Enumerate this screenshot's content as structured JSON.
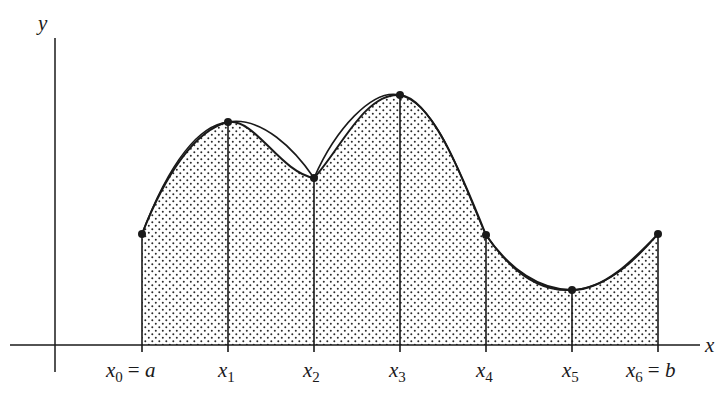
{
  "diagram": {
    "axes": {
      "x_label": "x",
      "y_label": "y"
    },
    "colors": {
      "ink": "#1a1a1a",
      "background": "#ffffff",
      "dot_fill": "#2a2a2a"
    },
    "partition_labels": [
      {
        "var": "x",
        "sub": "0",
        "suffix": "= a"
      },
      {
        "var": "x",
        "sub": "1",
        "suffix": ""
      },
      {
        "var": "x",
        "sub": "2",
        "suffix": ""
      },
      {
        "var": "x",
        "sub": "3",
        "suffix": ""
      },
      {
        "var": "x",
        "sub": "4",
        "suffix": ""
      },
      {
        "var": "x",
        "sub": "5",
        "suffix": ""
      },
      {
        "var": "x",
        "sub": "6",
        "suffix": "= b"
      }
    ],
    "points_px": [
      [
        142,
        234
      ],
      [
        228,
        122
      ],
      [
        314,
        178
      ],
      [
        400,
        95
      ],
      [
        486,
        235
      ],
      [
        572,
        290
      ],
      [
        658,
        234
      ]
    ],
    "shading": "dotted region under curve between x0 and x6",
    "curves": [
      "original function f(x)",
      "approximating parabolic arcs"
    ]
  }
}
